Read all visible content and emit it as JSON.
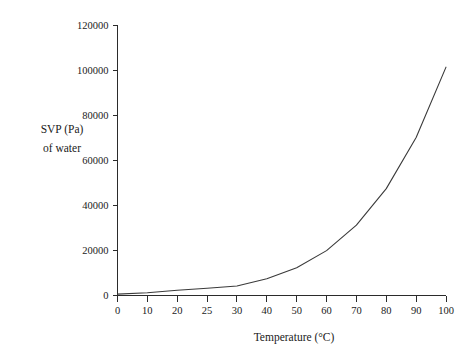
{
  "chart_data": {
    "type": "line",
    "title": "",
    "xlabel": "Temperature (°C)",
    "ylabel": "SVP (Pa) of water",
    "ylabel_lines": [
      "SVP (Pa)",
      "of water"
    ],
    "categories": [
      0,
      10,
      20,
      25,
      30,
      40,
      50,
      60,
      70,
      80,
      90,
      100
    ],
    "x_tick_labels": [
      "0",
      "10",
      "20",
      "25",
      "30",
      "40",
      "50",
      "60",
      "70",
      "80",
      "90",
      "100"
    ],
    "x_axis_scale": "categorical-even-spacing",
    "values": [
      600,
      1200,
      2300,
      3200,
      4200,
      7400,
      12300,
      19900,
      31200,
      47400,
      70100,
      101300
    ],
    "y_ticks": [
      0,
      20000,
      40000,
      60000,
      80000,
      100000,
      120000
    ],
    "y_tick_labels": [
      "0",
      "20000",
      "40000",
      "60000",
      "80000",
      "100000",
      "120000"
    ],
    "ylim": [
      0,
      120000
    ],
    "grid": false,
    "legend": false,
    "series_color": "#3a3a3a",
    "background_color": "#ffffff"
  }
}
